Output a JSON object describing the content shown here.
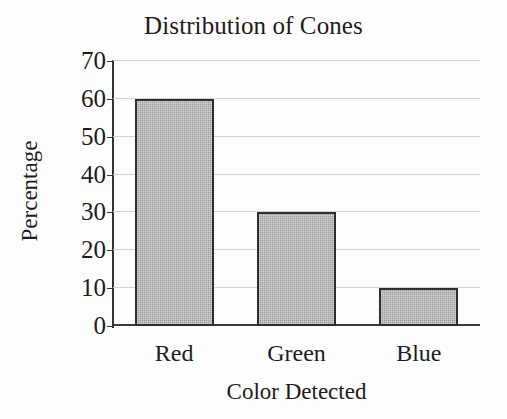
{
  "chart_data": {
    "type": "bar",
    "title": "Distribution of Cones",
    "xlabel": "Color Detected",
    "ylabel": "Percentage",
    "categories": [
      "Red",
      "Green",
      "Blue"
    ],
    "values": [
      60,
      30,
      10
    ],
    "series": [
      {
        "name": "Percentage",
        "values": [
          60,
          30,
          10
        ]
      }
    ],
    "ylim": [
      0,
      70
    ],
    "yticks": [
      0,
      10,
      20,
      30,
      40,
      50,
      60,
      70
    ],
    "ytick_labels": [
      "0",
      "10",
      "20",
      "30",
      "40",
      "50",
      "60",
      "70"
    ],
    "grid": "horizontal",
    "legend": "none",
    "bar_fill_color": "#9d9d9d",
    "bar_border_color": "#2e2e2e",
    "gridline_color": "#d2d2d2",
    "axis_color": "#333333",
    "background_color": "#fdfdfd",
    "text_color": "#1c1c1c"
  }
}
